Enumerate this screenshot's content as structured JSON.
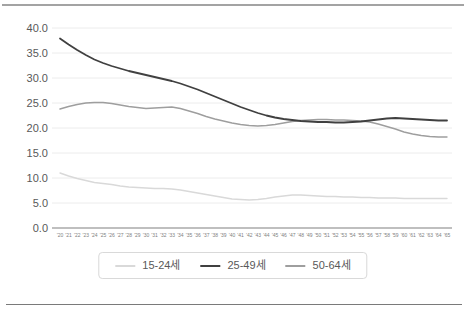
{
  "dividers": {
    "top_color": "#a3a3a3",
    "bottom_color": "#7a7a7a"
  },
  "chart_data": {
    "type": "line",
    "title": "",
    "xlabel": "",
    "ylabel": "",
    "ylim": [
      0,
      40
    ],
    "ytick_step": 5,
    "ytick_labels": [
      "0.0",
      "5.0",
      "10.0",
      "15.0",
      "20.0",
      "25.0",
      "30.0",
      "35.0",
      "40.0"
    ],
    "grid": true,
    "legend_position": "bottom",
    "axis_color": "#808080",
    "gridline_color": "#ececec",
    "ylabel_color": "#595959",
    "xlabel_color": "#7f7f7f",
    "x_labels": [
      "'20",
      "'21",
      "'22",
      "'23",
      "'24",
      "'25",
      "'26",
      "'27",
      "'28",
      "'29",
      "'30",
      "'31",
      "'32",
      "'33",
      "'34",
      "'35",
      "'36",
      "'37",
      "'38",
      "'39",
      "'40",
      "'41",
      "'42",
      "'43",
      "'44",
      "'45",
      "'46",
      "'47",
      "'48",
      "'49",
      "'50",
      "'51",
      "'52",
      "'53",
      "'54",
      "'55",
      "'56",
      "'57",
      "'58",
      "'59",
      "'60",
      "'61",
      "'62",
      "'63",
      "'64",
      "'65"
    ],
    "series": [
      {
        "name": "15-24세",
        "color": "#d9d9d9",
        "values": [
          11.0,
          10.4,
          9.9,
          9.5,
          9.1,
          8.9,
          8.7,
          8.4,
          8.2,
          8.1,
          8.0,
          7.9,
          7.9,
          7.8,
          7.6,
          7.3,
          7.0,
          6.7,
          6.4,
          6.1,
          5.8,
          5.7,
          5.6,
          5.7,
          5.9,
          6.2,
          6.4,
          6.6,
          6.6,
          6.5,
          6.4,
          6.3,
          6.3,
          6.2,
          6.2,
          6.1,
          6.1,
          6.0,
          6.0,
          6.0,
          5.9,
          5.9,
          5.9,
          5.9,
          5.9,
          5.9
        ]
      },
      {
        "name": "25-49세",
        "color": "#404040",
        "values": [
          37.9,
          36.7,
          35.6,
          34.6,
          33.7,
          33.0,
          32.4,
          31.9,
          31.4,
          31.0,
          30.6,
          30.2,
          29.8,
          29.4,
          28.9,
          28.3,
          27.7,
          27.0,
          26.3,
          25.6,
          24.9,
          24.2,
          23.6,
          23.0,
          22.5,
          22.1,
          21.8,
          21.6,
          21.4,
          21.3,
          21.2,
          21.2,
          21.1,
          21.1,
          21.2,
          21.3,
          21.5,
          21.7,
          21.9,
          22.0,
          21.9,
          21.8,
          21.7,
          21.6,
          21.5,
          21.5
        ]
      },
      {
        "name": "50-64세",
        "color": "#9e9e9e",
        "values": [
          23.8,
          24.3,
          24.7,
          25.0,
          25.1,
          25.1,
          24.9,
          24.6,
          24.3,
          24.1,
          23.9,
          24.0,
          24.1,
          24.2,
          23.9,
          23.4,
          22.9,
          22.3,
          21.8,
          21.4,
          21.0,
          20.7,
          20.5,
          20.4,
          20.5,
          20.7,
          21.0,
          21.3,
          21.5,
          21.6,
          21.7,
          21.7,
          21.6,
          21.6,
          21.5,
          21.4,
          21.2,
          20.8,
          20.3,
          19.8,
          19.2,
          18.8,
          18.5,
          18.3,
          18.2,
          18.2
        ]
      }
    ]
  }
}
